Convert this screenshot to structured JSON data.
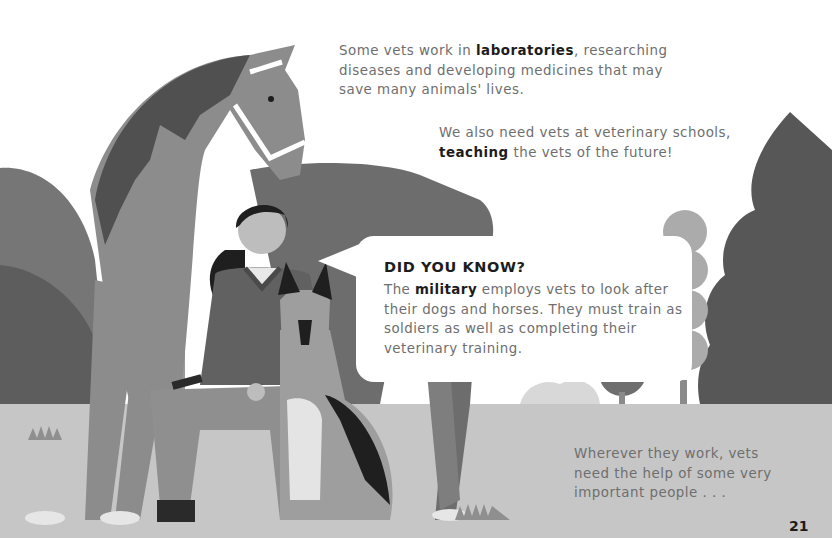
{
  "page": {
    "number": "21"
  },
  "paragraphs": {
    "laboratories": {
      "before": "Some vets work in ",
      "bold": "laboratories",
      "after": ", researching diseases and developing medicines that may save many animals' lives.",
      "lines": [
        "Some vets work in laboratories, researching",
        "diseases and developing medicines that",
        "may save many animals' lives."
      ]
    },
    "schools": {
      "line1": "We also need vets at veterinary schools,",
      "bold": "teaching",
      "after": " the vets of the future!"
    },
    "wherever": {
      "lines": [
        "Wherever they work, vets",
        "need the help of some very",
        "important people . . ."
      ]
    }
  },
  "did_you_know": {
    "title": "DID YOU KNOW?",
    "before": "The ",
    "bold": "military",
    "after": " employs vets to look after their dogs and horses. They must train as soldiers as well as completing their veterinary training."
  },
  "illustration": {
    "subjects": [
      "horse-with-halter",
      "vet-woman-kneeling",
      "german-shepherd-dog",
      "trees",
      "bushes",
      "grass-tufts"
    ],
    "colors": {
      "background": "#ffffff",
      "ground": "#c4c4c4",
      "horse_body": "#8c8c8c",
      "horse_mane": "#505050",
      "tree_dark": "#555555",
      "tree_light": "#a9a9a9",
      "bush_dark": "#6a6a6a",
      "vet_shirt": "#616161",
      "vet_trousers": "#8f8f8f",
      "dog_dark": "#1f1f1f",
      "text_body": "#6e6e6e",
      "text_bold": "#1c1c1c"
    }
  }
}
